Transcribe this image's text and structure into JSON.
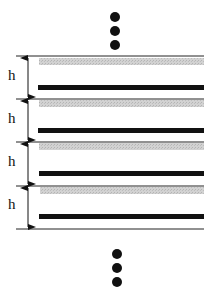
{
  "diagram": {
    "period_label": "h",
    "num_periods": 4,
    "continuation_marker": "ellipsis-dots",
    "colors": {
      "boundary_line": "#222222",
      "gray_layer": "#c8c8c8",
      "black_layer": "#111111",
      "arrow": "#111111"
    },
    "periods": [
      {
        "label": "h"
      },
      {
        "label": "h"
      },
      {
        "label": "h"
      },
      {
        "label": "h"
      }
    ]
  }
}
